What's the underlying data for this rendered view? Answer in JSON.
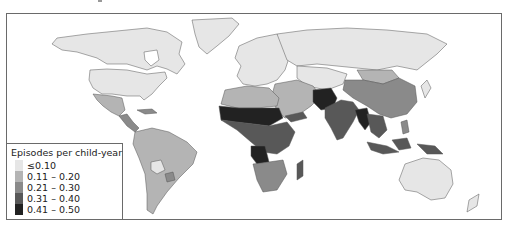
{
  "figure": {
    "type": "choropleth-map"
  },
  "legend": {
    "title": "Episodes per child-year",
    "items": [
      {
        "label": "≤0.10",
        "color": "#e6e6e6"
      },
      {
        "label": "0.11 – 0.20",
        "color": "#b4b4b4"
      },
      {
        "label": "0.21 – 0.30",
        "color": "#8a8a8a"
      },
      {
        "label": "0.31 – 0.40",
        "color": "#585858"
      },
      {
        "label": "0.41 – 0.50",
        "color": "#222222"
      }
    ]
  },
  "regions": [
    {
      "name": "North America (Canada, USA)",
      "class": "≤0.10"
    },
    {
      "name": "Greenland",
      "class": "≤0.10"
    },
    {
      "name": "Mexico",
      "class": "0.11 – 0.20"
    },
    {
      "name": "Central America & Caribbean",
      "class": "0.21 – 0.30"
    },
    {
      "name": "South America (most)",
      "class": "0.11 – 0.20"
    },
    {
      "name": "Bolivia / Paraguay region",
      "class": "≤0.10"
    },
    {
      "name": "Europe",
      "class": "≤0.10"
    },
    {
      "name": "Russia",
      "class": "≤0.10"
    },
    {
      "name": "North Africa (Maghreb)",
      "class": "0.11 – 0.20"
    },
    {
      "name": "Sahel belt",
      "class": "0.41 – 0.50"
    },
    {
      "name": "West & Central Africa",
      "class": "0.31 – 0.40"
    },
    {
      "name": "East Africa",
      "class": "0.31 – 0.40"
    },
    {
      "name": "Angola / DRC",
      "class": "0.41 – 0.50"
    },
    {
      "name": "Southern Africa",
      "class": "0.21 – 0.30"
    },
    {
      "name": "Madagascar",
      "class": "0.31 – 0.40"
    },
    {
      "name": "Middle East",
      "class": "0.11 – 0.20"
    },
    {
      "name": "Yemen",
      "class": "0.31 – 0.40"
    },
    {
      "name": "Afghanistan / Pakistan",
      "class": "0.41 – 0.50"
    },
    {
      "name": "India",
      "class": "0.31 – 0.40"
    },
    {
      "name": "Myanmar / Bangladesh",
      "class": "0.41 – 0.50"
    },
    {
      "name": "Mongolia",
      "class": "0.11 – 0.20"
    },
    {
      "name": "China",
      "class": "0.21 – 0.30"
    },
    {
      "name": "Southeast Asia / Indonesia",
      "class": "0.31 – 0.40"
    },
    {
      "name": "Papua New Guinea",
      "class": "0.31 – 0.40"
    },
    {
      "name": "Australia",
      "class": "≤0.10"
    },
    {
      "name": "New Zealand",
      "class": "≤0.10"
    }
  ]
}
